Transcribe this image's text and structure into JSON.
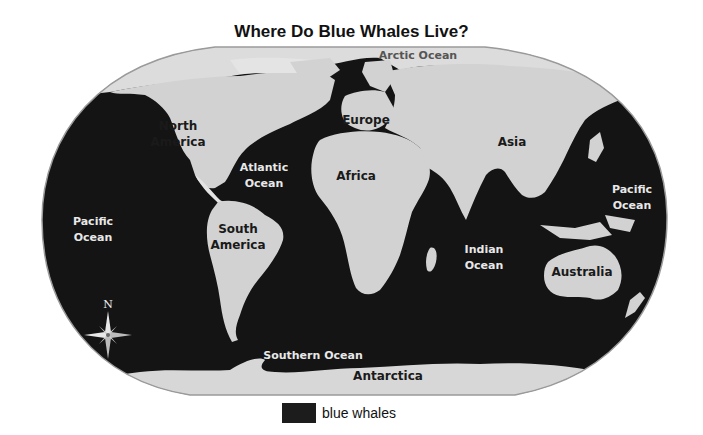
{
  "title": "Where Do Blue Whales Live?",
  "colors": {
    "ocean_whale_range": "#141414",
    "land": "#d2d2d2",
    "land_light": "#e4e4e4",
    "arctic_ice": "#dcdcdc",
    "background": "#ffffff"
  },
  "labels": {
    "arctic": "Arctic Ocean",
    "north_america_1": "North",
    "north_america_2": "America",
    "europe": "Europe",
    "asia": "Asia",
    "africa": "Africa",
    "atlantic_1": "Atlantic",
    "atlantic_2": "Ocean",
    "pacific_west_1": "Pacific",
    "pacific_west_2": "Ocean",
    "pacific_east_1": "Pacific",
    "pacific_east_2": "Ocean",
    "south_america_1": "South",
    "south_america_2": "America",
    "indian_1": "Indian",
    "indian_2": "Ocean",
    "australia": "Australia",
    "southern": "Southern Ocean",
    "antarctica": "Antarctica"
  },
  "compass": {
    "north_label": "N",
    "icon": "compass-rose-icon"
  },
  "legend": {
    "items": [
      {
        "label": "blue whales",
        "color": "#1c1c1c"
      }
    ]
  }
}
